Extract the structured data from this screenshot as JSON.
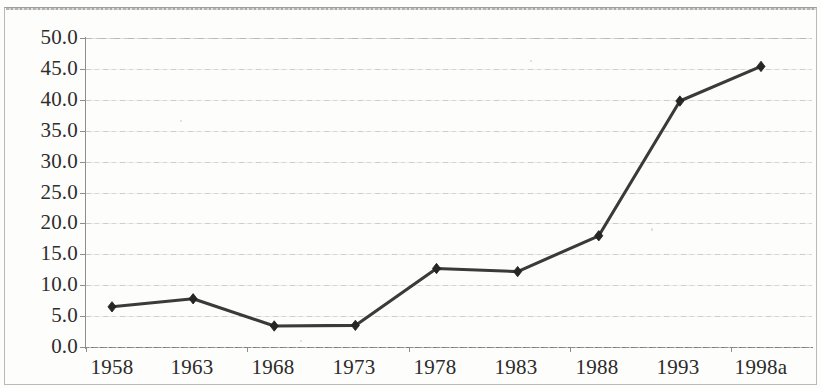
{
  "figure": {
    "background_color": "#fdfdfc",
    "frame_color": "#b9b9b6",
    "line_color": "#3a3a38",
    "marker_color": "#262624",
    "gridline_color": "#cacac6"
  },
  "chart_data": {
    "type": "line",
    "title": "",
    "subtitle": "",
    "xlabel": "",
    "ylabel": "",
    "categories": [
      "1958",
      "1963",
      "1968",
      "1973",
      "1978",
      "1983",
      "1988",
      "1993",
      "1998a"
    ],
    "values": [
      6.5,
      7.8,
      3.4,
      3.5,
      12.7,
      12.2,
      18.0,
      39.8,
      45.4
    ],
    "series": [
      {
        "name": "",
        "values": [
          6.5,
          7.8,
          3.4,
          3.5,
          12.7,
          12.2,
          18.0,
          39.8,
          45.4
        ]
      }
    ],
    "ylim": [
      0.0,
      50.0
    ],
    "ytick_step": 5.0,
    "ytick_labels": [
      "50.0",
      "45.0",
      "40.0",
      "35.0",
      "30.0",
      "25.0",
      "20.0",
      "15.0",
      "10.0",
      "5.0",
      "0.0"
    ],
    "ytick_values": [
      50.0,
      45.0,
      40.0,
      35.0,
      30.0,
      25.0,
      20.0,
      15.0,
      10.0,
      5.0,
      0.0
    ],
    "xtick_labels": [
      "1958",
      "1963",
      "1968",
      "1973",
      "1978",
      "1983",
      "1988",
      "1993",
      "1998a"
    ],
    "grid": true,
    "grid_axis": "y",
    "legend": false,
    "legend_position": "none",
    "marker": "diamond",
    "annotations": []
  }
}
